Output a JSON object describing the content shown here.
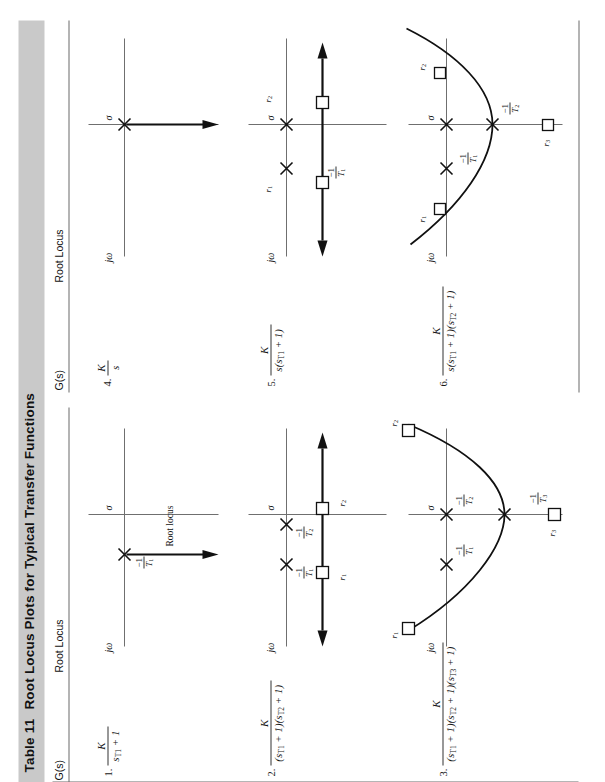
{
  "table": {
    "number_label": "Table 11",
    "title": "Root Locus Plots for Typical Transfer Functions",
    "header_bg": "#c9c9c9",
    "column_headers": {
      "gs": "G(s)",
      "root_locus": "Root Locus"
    },
    "annotation_root_locus": "Root locus"
  },
  "axis_labels": {
    "jw": "jω",
    "sigma": "σ"
  },
  "entries": [
    {
      "index": "1.",
      "numerator": "K",
      "denominator": "sT₁ + 1",
      "denominator_parts": [
        {
          "t": "s",
          "i": true
        },
        {
          "t": "T",
          "i": true,
          "sub": "1"
        },
        {
          "t": " + 1",
          "i": false
        }
      ],
      "pole_ticks": [
        "-1/T₁"
      ],
      "column": "left",
      "row": 1
    },
    {
      "index": "2.",
      "numerator": "K",
      "denominator": "(sT₁ + 1)(sT₂ + 1)",
      "pole_ticks": [
        "-1/T₁",
        "-1/T₂"
      ],
      "asymptote_labels": [
        "r₁",
        "r₂"
      ],
      "column": "left",
      "row": 2
    },
    {
      "index": "3.",
      "numerator": "K",
      "denominator": "(sT₁ + 1)(sT₂ + 1)(sT₃ + 1)",
      "pole_ticks": [
        "-1/T₁",
        "-1/T₂",
        "-1/T₃"
      ],
      "asymptote_labels": [
        "r₁",
        "r₂",
        "r₃"
      ],
      "column": "left",
      "row": 3
    },
    {
      "index": "4.",
      "numerator": "K",
      "denominator": "s",
      "pole_ticks": [],
      "column": "right",
      "row": 1
    },
    {
      "index": "5.",
      "numerator": "K",
      "denominator": "s(sT₁ + 1)",
      "pole_ticks": [
        "-1/T₁"
      ],
      "asymptote_labels": [
        "r₁",
        "r₂"
      ],
      "column": "right",
      "row": 2
    },
    {
      "index": "6.",
      "numerator": "K",
      "denominator": "s(sT₁ + 1)(sT₂ + 1)",
      "pole_ticks": [
        "-1/T₁",
        "-1/T₂"
      ],
      "asymptote_labels": [
        "r₁",
        "r₂",
        "r₃"
      ],
      "column": "right",
      "row": 3
    }
  ]
}
